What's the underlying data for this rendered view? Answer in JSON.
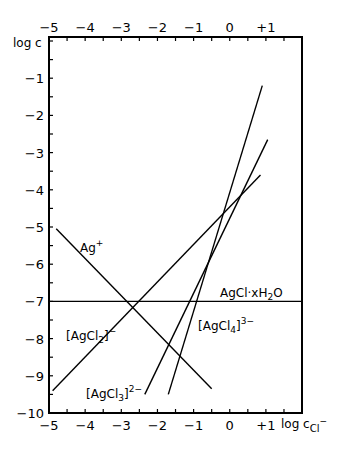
{
  "chart_data": {
    "type": "line",
    "title": "",
    "xlabel": "log c_Cl-",
    "ylabel": "log c",
    "xlim": [
      -5,
      2
    ],
    "ylim": [
      -10,
      0.1
    ],
    "grid": false,
    "legend": "none (inline labels)",
    "x_ticks": [
      "-5",
      "-4",
      "-3",
      "-2",
      "-1",
      "0",
      "+1"
    ],
    "x_tick_values": [
      -5,
      -4,
      -3,
      -2,
      -1,
      0,
      1
    ],
    "top_x_ticks": [
      "-5",
      "-4",
      "-3",
      "-2",
      "-1",
      "0",
      "+1"
    ],
    "y_ticks": [
      "-1",
      "-2",
      "-3",
      "-4",
      "-5",
      "-6",
      "-7",
      "-8",
      "-9",
      "-10"
    ],
    "y_tick_values": [
      -1,
      -2,
      -3,
      -4,
      -5,
      -6,
      -7,
      -8,
      -9,
      -10
    ],
    "series": [
      {
        "name": "Ag+",
        "label": "Ag",
        "sup": "+",
        "x": [
          -4.8,
          -0.5
        ],
        "y": [
          -5.05,
          -9.35
        ]
      },
      {
        "name": "AgCl·xH2O",
        "label": "AgCl·xH",
        "sub": "2",
        "tail": "O",
        "x": [
          -5,
          2
        ],
        "y": [
          -7,
          -7
        ]
      },
      {
        "name": "[AgCl2]-",
        "label": "[AgCl",
        "sub": "2",
        "tail": "]",
        "sup": "−",
        "x": [
          -4.9,
          0.85
        ],
        "y": [
          -9.4,
          -3.6
        ]
      },
      {
        "name": "[AgCl3]2-",
        "label": "[AgCl",
        "sub": "3",
        "tail": "]",
        "sup": "2−",
        "x": [
          -2.35,
          1.05
        ],
        "y": [
          -9.5,
          -2.65
        ]
      },
      {
        "name": "[AgCl4]3-",
        "label": "[AgCl",
        "sub": "4",
        "tail": "]",
        "sup": "3−",
        "x": [
          -1.7,
          0.9
        ],
        "y": [
          -9.5,
          -1.2
        ]
      }
    ]
  },
  "axis_labels": {
    "y": "log c",
    "x_main": "log c",
    "x_sub": "Cl",
    "x_sup": "−"
  }
}
